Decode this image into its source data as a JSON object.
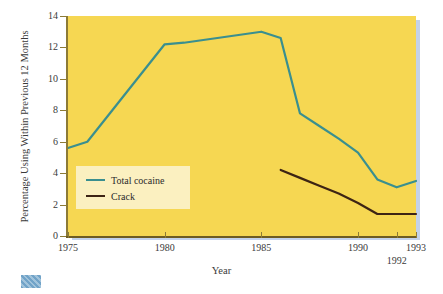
{
  "chart_data": {
    "type": "line",
    "title": "",
    "xlabel": "Year",
    "ylabel": "Percentage Using Within Previous 12 Months",
    "xlim": [
      1975,
      1993
    ],
    "ylim": [
      0,
      14
    ],
    "yticks": [
      0,
      2,
      4,
      6,
      8,
      10,
      12,
      14
    ],
    "ytick_labels": [
      "0",
      "2",
      "4",
      "6",
      "8",
      "10",
      "12",
      "14"
    ],
    "xticks": [
      1975,
      1980,
      1985,
      1990,
      1992,
      1993
    ],
    "xtick_labels": [
      "1975",
      "1980",
      "1985",
      "1990",
      "1992",
      "1993"
    ],
    "grid": false,
    "legend_position": "lower-left-inside",
    "plot_background": "#f6d752",
    "legend_background": "#fbf0c0",
    "series": [
      {
        "name": "Total cocaine",
        "color": "#3a8f8f",
        "x": [
          1975,
          1976,
          1980,
          1981,
          1985,
          1986,
          1987,
          1988,
          1989,
          1990,
          1991,
          1992,
          1993
        ],
        "values": [
          5.6,
          6.0,
          12.2,
          12.3,
          13.0,
          12.6,
          7.8,
          7.0,
          6.2,
          5.3,
          3.6,
          3.1,
          3.5
        ]
      },
      {
        "name": "Crack",
        "color": "#3d2414",
        "x": [
          1986,
          1987,
          1988,
          1989,
          1990,
          1991,
          1992,
          1993
        ],
        "values": [
          4.2,
          3.7,
          3.2,
          2.7,
          2.1,
          1.4,
          1.4,
          1.4
        ]
      }
    ]
  },
  "axis": {
    "x_title": "Year",
    "y_title": "Percentage Using Within Previous 12 Months"
  },
  "legend": {
    "items": [
      {
        "label": "Total cocaine",
        "color": "#3a8f8f"
      },
      {
        "label": "Crack",
        "color": "#3d2414"
      }
    ]
  }
}
